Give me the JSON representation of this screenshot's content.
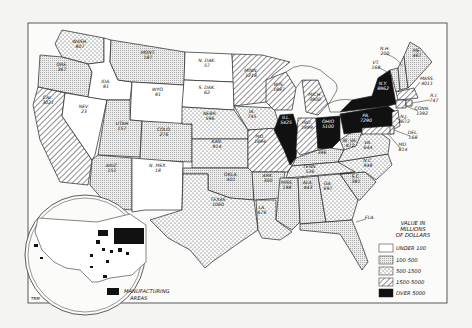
{
  "legend": {
    "title_lines": [
      "VALUE IN",
      "MILLIONS",
      "OF DOLLARS"
    ],
    "items": [
      {
        "label": "UNDER 100",
        "fill": "white"
      },
      {
        "label": "100-500",
        "fill": "fine-stipple"
      },
      {
        "label": "500-1500",
        "fill": "coarse-dots"
      },
      {
        "label": "1500-5000",
        "fill": "diagonal-hatch"
      },
      {
        "label": "OVER 5000",
        "fill": "black"
      }
    ]
  },
  "inset": {
    "legend_label_lines": [
      "MANUFACTURING",
      "AREAS"
    ]
  },
  "signature": "TRM",
  "states": {
    "wash": {
      "name": "WASH.",
      "value": "807"
    },
    "ore": {
      "name": "ORE.",
      "value": "367"
    },
    "cal": {
      "name": "CAL.",
      "value": "3021"
    },
    "nev": {
      "name": "NEV.",
      "value": "23"
    },
    "ida": {
      "name": "IDA.",
      "value": "81"
    },
    "mont": {
      "name": "MONT.",
      "value": "187"
    },
    "wyo": {
      "name": "WYO.",
      "value": "81"
    },
    "utah": {
      "name": "UTAH",
      "value": "157"
    },
    "colo": {
      "name": "COLO.",
      "value": "276"
    },
    "ariz": {
      "name": "ARIZ.",
      "value": "151"
    },
    "nmex": {
      "name": "N. MEX.",
      "value": "18"
    },
    "ndak": {
      "name": "N. DAK.",
      "value": "57"
    },
    "sdak": {
      "name": "S. DAK.",
      "value": "62"
    },
    "nebr": {
      "name": "NEBR.",
      "value": "596"
    },
    "kan": {
      "name": "KAN.",
      "value": "914"
    },
    "okla": {
      "name": "OKLA.",
      "value": "401"
    },
    "texas": {
      "name": "TEXAS",
      "value": "1060"
    },
    "minn": {
      "name": "MINN.",
      "value": "1218"
    },
    "ia": {
      "name": "IA.",
      "value": "745"
    },
    "mo": {
      "name": "MO.",
      "value": "1894"
    },
    "ark": {
      "name": "ARK.",
      "value": "300"
    },
    "la": {
      "name": "LA.",
      "value": "676"
    },
    "wis": {
      "name": "WIS.",
      "value": "1887"
    },
    "ill": {
      "name": "ILL.",
      "value": "5425"
    },
    "mich": {
      "name": "MICH.",
      "value": "3900"
    },
    "ind": {
      "name": "IND.",
      "value": "1899"
    },
    "ohio": {
      "name": "OHIO",
      "value": "5100"
    },
    "ky": {
      "name": "KY.",
      "value": "396"
    },
    "tenn": {
      "name": "TENN.",
      "value": "536"
    },
    "miss": {
      "name": "MISS.",
      "value": "198"
    },
    "ala": {
      "name": "ALA.",
      "value": "443"
    },
    "ga": {
      "name": "GA.",
      "value": "697"
    },
    "fla": {
      "name": "FLA.",
      "value": ""
    },
    "sc": {
      "name": "S.C.",
      "value": "381"
    },
    "nc": {
      "name": "N.C.",
      "value": "948"
    },
    "va": {
      "name": "VA.",
      "value": "644"
    },
    "wva": {
      "name": "W. VA.",
      "value": "472"
    },
    "pa": {
      "name": "PA.",
      "value": "7290"
    },
    "ny": {
      "name": "N.Y.",
      "value": "8962"
    },
    "vt": {
      "name": "VT.",
      "value": "168"
    },
    "nh": {
      "name": "N.H.",
      "value": "200"
    },
    "me": {
      "name": "ME.",
      "value": "467"
    },
    "mass": {
      "name": "MASS.",
      "value": "4011"
    },
    "ri": {
      "name": "R.I.",
      "value": "747"
    },
    "conn": {
      "name": "CONN.",
      "value": "1392"
    },
    "nj": {
      "name": "N.J.",
      "value": "3672"
    },
    "del": {
      "name": "DEL.",
      "value": "168"
    },
    "md": {
      "name": "MD.",
      "value": "814"
    }
  }
}
